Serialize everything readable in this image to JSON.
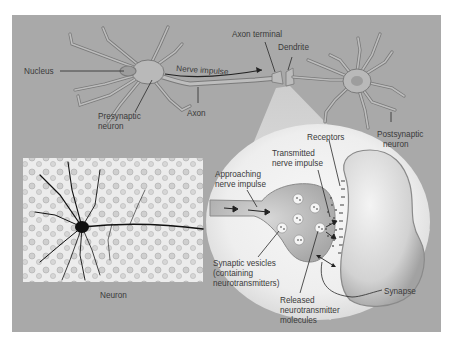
{
  "figure": {
    "background_color": "#ffffff",
    "panel_color": "#a9a9a9",
    "spotlight_color": "#f2f2f2",
    "neuron_fill": "#b9b9b9",
    "neuron_outline": "#7a7a7a"
  },
  "top_diagram": {
    "labels": {
      "nucleus": "Nucleus",
      "presynaptic_line1": "Presynaptic",
      "presynaptic_line2": "neuron",
      "nerve_impulse": "Nerve impulse",
      "axon": "Axon",
      "axon_terminal": "Axon terminal",
      "dendrite": "Dendrite",
      "postsynaptic_line1": "Postsynaptic",
      "postsynaptic_line2": "neuron"
    }
  },
  "micrograph": {
    "caption": "Neuron"
  },
  "synapse_detail": {
    "labels": {
      "receptors": "Receptors",
      "transmitted_line1": "Transmitted",
      "transmitted_line2": "nerve impulse",
      "approaching_line1": "Approaching",
      "approaching_line2": "nerve impulse",
      "vesicles_line1": "Synaptic vesicles",
      "vesicles_line2": "(containing",
      "vesicles_line3": "neurotransmitters)",
      "released_line1": "Released",
      "released_line2": "neurotransmitter",
      "released_line3": "molecules",
      "synapse": "Synapse"
    }
  }
}
